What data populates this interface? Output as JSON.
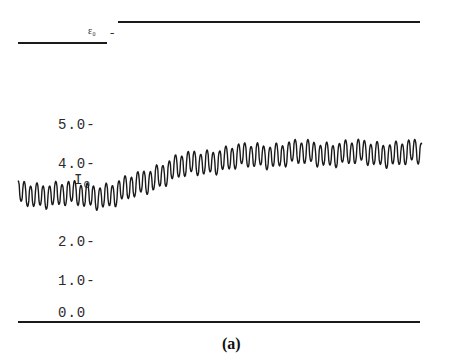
{
  "figure": {
    "caption": "(a)",
    "strain_label": "ε₀",
    "strain_dash": "-",
    "intensity_label": "I",
    "intensity_subscript": "0",
    "hidden_label": "ε₀",
    "colors": {
      "ink": "#1a1a1a",
      "background": "#ffffff"
    }
  },
  "axis": {
    "ticks": [
      "5.0-",
      "4.0-",
      "2.0-",
      "1.0-",
      "0.0"
    ]
  },
  "chart_data": {
    "type": "line",
    "title": "",
    "caption": "(a)",
    "xlabel": "",
    "ylabel": "I0",
    "ylim": [
      0,
      5.2
    ],
    "y_ticks": [
      0.0,
      1.0,
      2.0,
      3.0,
      4.0,
      5.0
    ],
    "grid": false,
    "legend": null,
    "step_trace": {
      "name": "ε0 (applied strain step)",
      "levels": [
        "low",
        "high"
      ],
      "step_x_fraction": 0.24
    },
    "series": [
      {
        "name": "I0 (oscillating intensity)",
        "description": "Rapid oscillation; mean ~3.2 before step, rises smoothly after strain step and plateaus ~4.3",
        "x_fraction": [
          0.0,
          0.1,
          0.2,
          0.24,
          0.3,
          0.35,
          0.4,
          0.45,
          0.5,
          0.6,
          0.7,
          0.8,
          0.9,
          1.0
        ],
        "mean": [
          3.25,
          3.25,
          3.22,
          3.25,
          3.5,
          3.75,
          3.95,
          4.05,
          4.15,
          4.25,
          4.3,
          4.3,
          4.3,
          4.3
        ],
        "amplitude": [
          0.28,
          0.28,
          0.28,
          0.28,
          0.28,
          0.28,
          0.28,
          0.28,
          0.28,
          0.28,
          0.28,
          0.28,
          0.28,
          0.28
        ]
      }
    ]
  }
}
